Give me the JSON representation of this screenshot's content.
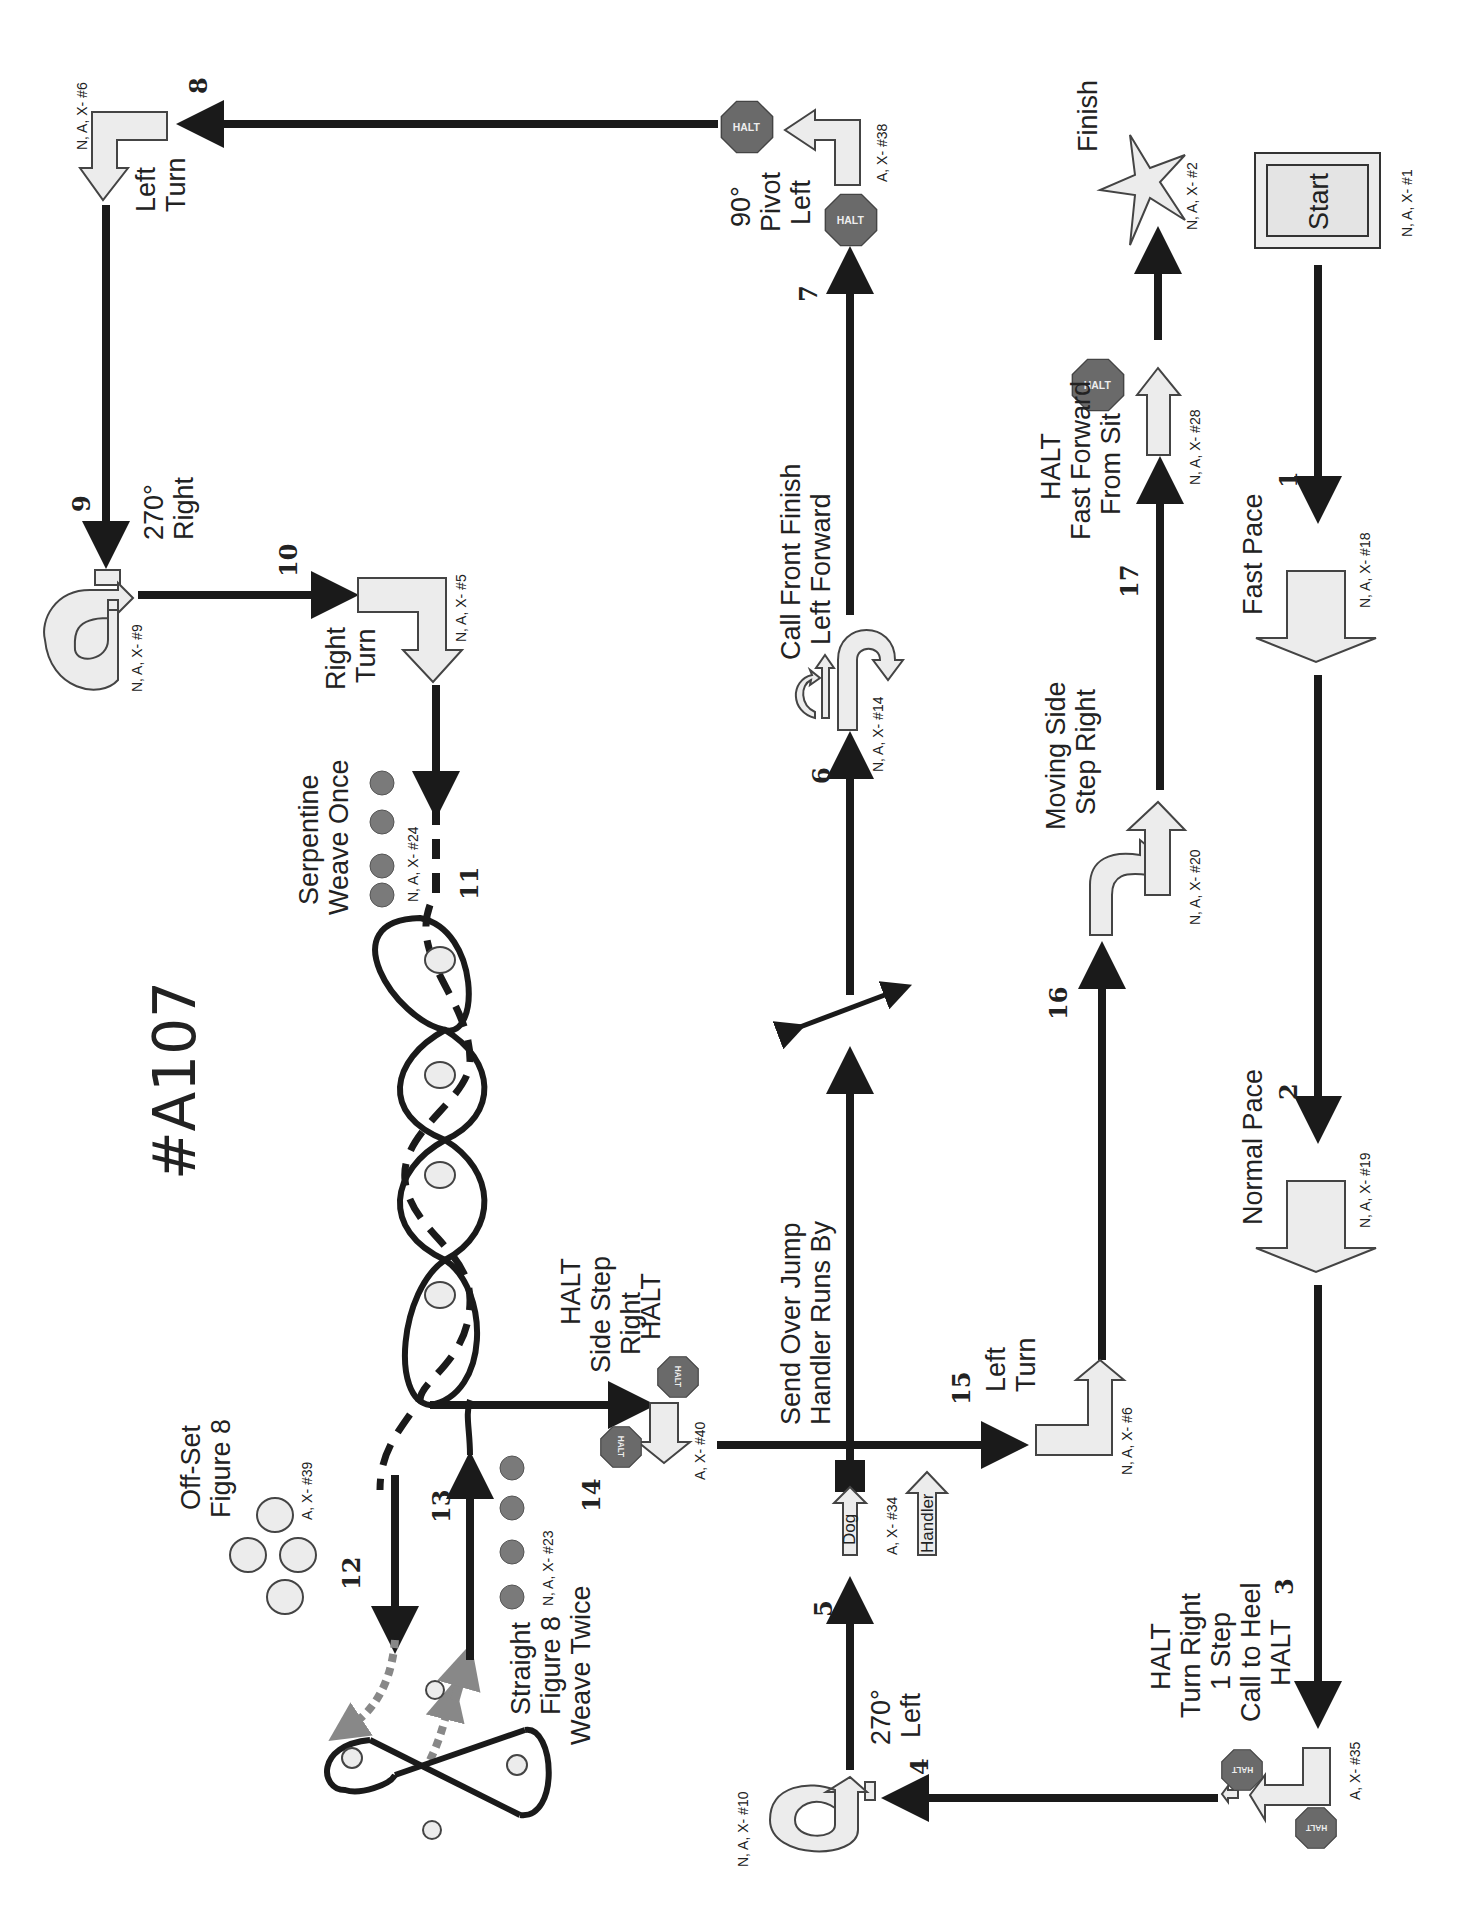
{
  "course": {
    "title": "#A107",
    "orientation": "rotated 90° counter-clockwise"
  },
  "stations": [
    {
      "num": "",
      "name": "Start",
      "code": "N, A, X- #1"
    },
    {
      "num": "1",
      "name": "Fast Pace",
      "code": "N, A, X- #18"
    },
    {
      "num": "2",
      "name": "Normal Pace",
      "code": "N, A, X- #19"
    },
    {
      "num": "3",
      "name": "HALT Turn Right 1 Step Call to Heel HALT",
      "code": "A, X- #35",
      "lines": [
        "HALT",
        "Turn Right",
        "1 Step",
        "Call to Heel",
        "HALT"
      ]
    },
    {
      "num": "4",
      "name": "270° Left",
      "code": "N, A, X- #10",
      "lines": [
        "270°",
        "Left"
      ]
    },
    {
      "num": "5",
      "name": "Send Over Jump Handler Runs By",
      "code": "A, X- #34",
      "lines": [
        "Send Over Jump",
        "Handler Runs By"
      ],
      "dog_label": "Dog",
      "handler_label": "Handler"
    },
    {
      "num": "6",
      "name": "Call Front Finish Left Forward",
      "code": "N, A, X- #14",
      "lines": [
        "Call Front Finish",
        "Left Forward"
      ]
    },
    {
      "num": "7",
      "name": "90° Pivot Left",
      "code": "A, X- #38",
      "lines": [
        "90°",
        "Pivot",
        "Left"
      ]
    },
    {
      "num": "8",
      "name": "Left Turn",
      "code": "N, A, X- #6",
      "lines": [
        "Left",
        "Turn"
      ]
    },
    {
      "num": "9",
      "name": "270° Right",
      "code": "N, A, X- #9",
      "lines": [
        "270°",
        "Right"
      ]
    },
    {
      "num": "10",
      "name": "Right Turn",
      "code": "N, A, X- #5",
      "lines": [
        "Right",
        "Turn"
      ]
    },
    {
      "num": "11",
      "name": "Serpentine Weave Once",
      "code": "N, A, X- #24",
      "lines": [
        "Serpentine",
        "Weave Once"
      ]
    },
    {
      "num": "12",
      "name": "Off-Set Figure 8",
      "code": "A, X- #39",
      "lines": [
        "Off-Set",
        "Figure 8"
      ]
    },
    {
      "num": "13",
      "name": "Straight Figure 8 Weave Twice",
      "code": "N, A, X- #23",
      "lines": [
        "Straight",
        "Figure 8",
        "Weave Twice"
      ]
    },
    {
      "num": "14",
      "name": "HALT Side Step Right HALT",
      "code": "A, X- #40",
      "lines": [
        "HALT",
        "Side Step",
        "Right",
        "HALT"
      ]
    },
    {
      "num": "15",
      "name": "Left Turn",
      "code": "N, A, X- #6",
      "lines": [
        "Left",
        "Turn"
      ]
    },
    {
      "num": "16",
      "name": "Moving Side Step Right",
      "code": "N, A, X- #20",
      "lines": [
        "Moving Side",
        "Step Right"
      ]
    },
    {
      "num": "17",
      "name": "HALT Fast Forward From Sit",
      "code": "N, A, X- #28",
      "lines": [
        "HALT",
        "Fast Forward",
        "From Sit"
      ]
    },
    {
      "num": "",
      "name": "Finish",
      "code": "N, A, X- #2"
    }
  ],
  "halt_sign_text": "HALT",
  "colors": {
    "path": "#1a1a1a",
    "sign_fill": "#ececec",
    "halt_fill": "#6a6a6a",
    "dashed_gray": "#888888"
  }
}
